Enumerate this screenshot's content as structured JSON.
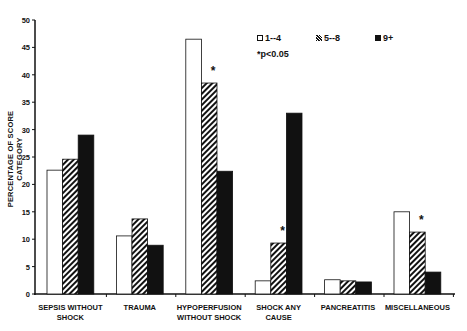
{
  "chart_data": {
    "type": "bar",
    "title": "",
    "xlabel": "",
    "ylabel": "PERCENTAGE OF SCORE CATEGORY",
    "ylim": [
      0,
      50
    ],
    "yticks": [
      0,
      5,
      10,
      15,
      20,
      25,
      30,
      35,
      40,
      45,
      50
    ],
    "categories": [
      "SEPSIS WITHOUT SHOCK",
      "TRAUMA",
      "HYPOPERFUSION WITHOUT SHOCK",
      "SHOCK ANY CAUSE",
      "PANCREATITIS",
      "MISCELLANEOUS"
    ],
    "category_lines": [
      [
        "SEPSIS WITHOUT",
        "SHOCK"
      ],
      [
        "TRAUMA"
      ],
      [
        "HYPOPERFUSION",
        "WITHOUT SHOCK"
      ],
      [
        "SHOCK ANY",
        "CAUSE"
      ],
      [
        "PANCREATITIS"
      ],
      [
        "MISCELLANEOUS"
      ]
    ],
    "series": [
      {
        "name": "1--4",
        "pattern": "open",
        "values": [
          22.6,
          10.6,
          46.5,
          2.4,
          2.6,
          15.0
        ]
      },
      {
        "name": "5--8",
        "pattern": "hatched",
        "values": [
          24.6,
          13.7,
          38.5,
          9.3,
          2.4,
          11.3
        ]
      },
      {
        "name": "9+",
        "pattern": "solid",
        "values": [
          29.0,
          8.9,
          22.4,
          33.0,
          2.2,
          4.0
        ]
      }
    ],
    "significance_markers": [
      {
        "category": "HYPOPERFUSION WITHOUT SHOCK",
        "series": "5--8",
        "symbol": "*"
      },
      {
        "category": "SHOCK ANY CAUSE",
        "series": "5--8",
        "symbol": "*"
      },
      {
        "category": "MISCELLANEOUS",
        "series": "5--8",
        "symbol": "*"
      }
    ],
    "annotation": "*p<0.05",
    "legend_position": "top-right",
    "grid": false
  },
  "legend": {
    "items": [
      {
        "label": "1--4"
      },
      {
        "label": "5--8"
      },
      {
        "label": "9+"
      }
    ],
    "note": "*p<0.05"
  },
  "colors": {
    "ink": "#111111",
    "background": "#ffffff"
  }
}
